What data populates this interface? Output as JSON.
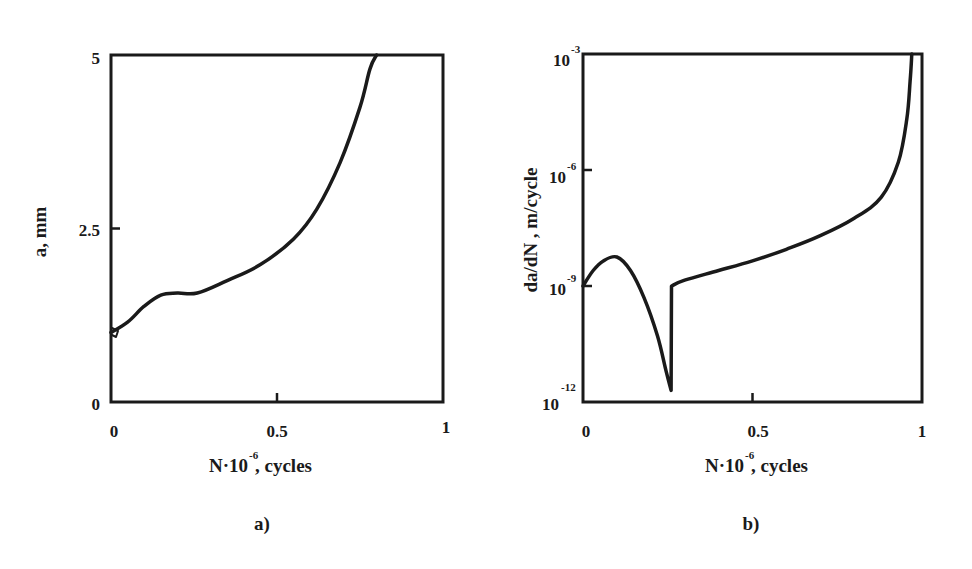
{
  "chart_data": [
    {
      "id": "a",
      "type": "line",
      "caption": "a)",
      "title": "",
      "xlabel": "N·10^-6, cycles",
      "xlabel_main": "N·10",
      "xlabel_exp": "-6",
      "xlabel_suffix": ", cycles",
      "ylabel": "a, mm",
      "xlim": [
        0,
        1
      ],
      "ylim": [
        0,
        5
      ],
      "yscale": "linear",
      "grid": false,
      "legend": null,
      "xticks": [
        0,
        0.5,
        1
      ],
      "xtick_labels": [
        "0",
        "0.5",
        "1"
      ],
      "yticks": [
        0,
        2.5,
        5
      ],
      "ytick_labels": [
        "0",
        "2.5",
        "5"
      ],
      "series": [
        {
          "name": "crack length",
          "x": [
            0.0,
            0.05,
            0.1,
            0.15,
            0.2,
            0.26,
            0.35,
            0.45,
            0.55,
            0.62,
            0.69,
            0.75,
            0.78,
            0.8
          ],
          "y": [
            1.0,
            1.15,
            1.38,
            1.54,
            1.57,
            1.57,
            1.75,
            1.98,
            2.35,
            2.78,
            3.45,
            4.25,
            4.8,
            5.0
          ]
        }
      ]
    },
    {
      "id": "b",
      "type": "line",
      "caption": "b)",
      "title": "",
      "xlabel": "N·10^-6, cycles",
      "xlabel_main": "N·10",
      "xlabel_exp": "-6",
      "xlabel_suffix": ", cycles",
      "ylabel": "da/dN , m/cycle",
      "xlim": [
        0,
        1
      ],
      "ylim_exp": [
        -12,
        -3
      ],
      "ylim": [
        1e-12,
        0.001
      ],
      "yscale": "log",
      "grid": false,
      "legend": null,
      "xticks": [
        0,
        0.5,
        1
      ],
      "xtick_labels": [
        "0",
        "0.5",
        "1"
      ],
      "yticks_exp": [
        -12,
        -9,
        -6,
        -3
      ],
      "ytick_base": "10",
      "ytick_exps": [
        "-12",
        "-9",
        "-6",
        "-3"
      ],
      "series": [
        {
          "name": "crack growth rate",
          "x": [
            0.0,
            0.03,
            0.06,
            0.1,
            0.14,
            0.18,
            0.22,
            0.245,
            0.26,
            0.261,
            0.3,
            0.4,
            0.5,
            0.6,
            0.7,
            0.8,
            0.88,
            0.93,
            0.955,
            0.965,
            0.97
          ],
          "log10_y": [
            -9.0,
            -8.6,
            -8.35,
            -8.25,
            -8.6,
            -9.3,
            -10.3,
            -11.2,
            -11.7,
            -9.0,
            -8.85,
            -8.6,
            -8.35,
            -8.05,
            -7.7,
            -7.25,
            -6.7,
            -5.8,
            -4.7,
            -3.7,
            -3.0
          ]
        }
      ]
    }
  ]
}
